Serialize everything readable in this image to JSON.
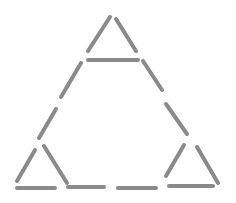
{
  "diagram": {
    "title": "",
    "stick_color": "#8a8a8a",
    "background": "#ffffff",
    "stick_width": 4,
    "sticks": [
      {
        "id": "top-left",
        "x1": 88,
        "y1": 51,
        "x2": 110,
        "y2": 17
      },
      {
        "id": "top-right",
        "x1": 116,
        "y1": 19,
        "x2": 136,
        "y2": 51
      },
      {
        "id": "top-base",
        "x1": 88,
        "y1": 60,
        "x2": 138,
        "y2": 60
      },
      {
        "id": "left-upper",
        "x1": 81,
        "y1": 63,
        "x2": 61,
        "y2": 97
      },
      {
        "id": "left-middle",
        "x1": 56,
        "y1": 109,
        "x2": 39,
        "y2": 138
      },
      {
        "id": "bottom-left-left",
        "x1": 35,
        "y1": 150,
        "x2": 17,
        "y2": 181
      },
      {
        "id": "bottom-left-right",
        "x1": 44,
        "y1": 146,
        "x2": 67,
        "y2": 183
      },
      {
        "id": "bottom-left-base",
        "x1": 17,
        "y1": 188,
        "x2": 55,
        "y2": 188
      },
      {
        "id": "bottom-middle-1",
        "x1": 68,
        "y1": 187,
        "x2": 104,
        "y2": 187
      },
      {
        "id": "bottom-middle-2",
        "x1": 118,
        "y1": 188,
        "x2": 156,
        "y2": 188
      },
      {
        "id": "bottom-right-base",
        "x1": 169,
        "y1": 186,
        "x2": 213,
        "y2": 186
      },
      {
        "id": "bottom-right-left",
        "x1": 166,
        "y1": 176,
        "x2": 184,
        "y2": 145
      },
      {
        "id": "bottom-right-right",
        "x1": 197,
        "y1": 147,
        "x2": 218,
        "y2": 183
      },
      {
        "id": "right-upper",
        "x1": 143,
        "y1": 61,
        "x2": 162,
        "y2": 90
      },
      {
        "id": "right-middle",
        "x1": 166,
        "y1": 104,
        "x2": 187,
        "y2": 134
      }
    ]
  }
}
